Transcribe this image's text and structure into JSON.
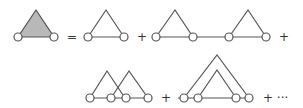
{
  "diagram": {
    "colors": {
      "stroke": "#555555",
      "shaded_fill": "#b8b8b8",
      "node_fill": "#ffffff"
    },
    "operators": {
      "equals": "=",
      "plus1": "+",
      "plus2": "+",
      "plus3": "+",
      "plus4": "+",
      "ellipsis": "+ ···"
    },
    "terms": [
      {
        "id": "lhs",
        "label": "shaded triangle (full vertex)"
      },
      {
        "id": "term1",
        "label": "single triangle"
      },
      {
        "id": "term2",
        "label": "two triangles in series"
      },
      {
        "id": "term3",
        "label": "two overlapping (crossed) triangles"
      },
      {
        "id": "term4",
        "label": "two nested triangles"
      }
    ]
  }
}
